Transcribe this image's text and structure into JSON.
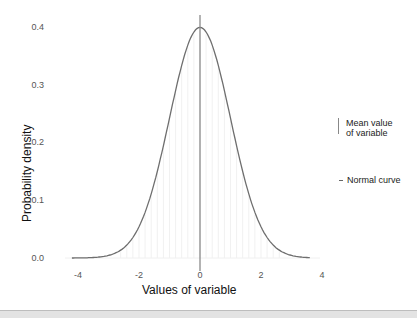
{
  "chart_data": {
    "type": "line",
    "title": "",
    "xlabel": "Values of variable",
    "ylabel": "Probability density",
    "xlim": [
      -4.3,
      4.0
    ],
    "ylim": [
      0.0,
      0.42
    ],
    "x_ticks": [
      "-4",
      "-2",
      "0",
      "2",
      "4"
    ],
    "y_ticks": [
      "0.0",
      "0.1",
      "0.2",
      "0.3",
      "0.4"
    ],
    "grid": false,
    "legend_position": "right",
    "series": [
      {
        "name": "Normal curve",
        "distribution": "standard normal (mean 0, sd 1)",
        "x": [
          -4.2,
          -4.0,
          -3.5,
          -3.0,
          -2.5,
          -2.0,
          -1.5,
          -1.0,
          -0.5,
          0.0,
          0.5,
          1.0,
          1.5,
          2.0,
          2.5,
          3.0,
          3.6
        ],
        "values": [
          0.0001,
          0.0001,
          0.0009,
          0.0044,
          0.0175,
          0.054,
          0.1295,
          0.242,
          0.3521,
          0.3989,
          0.3521,
          0.242,
          0.1295,
          0.054,
          0.0175,
          0.0044,
          0.0006
        ],
        "color": "#6e6e6e"
      },
      {
        "name": "Mean value of variable",
        "type": "vline",
        "x": 0,
        "color": "#8a8a8a"
      }
    ],
    "annotations": [
      "faint vertical fill lines under the curve"
    ]
  },
  "legend": {
    "items": [
      {
        "label_line1": "Mean value",
        "label_line2": "of variable",
        "key": "vertical-line"
      },
      {
        "label_line1": "Normal curve",
        "key": "horizontal-line"
      }
    ]
  }
}
